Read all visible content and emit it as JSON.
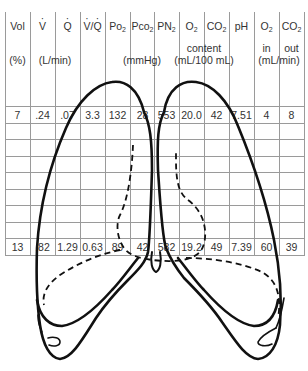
{
  "figure": {
    "columns": [
      {
        "key": "vol",
        "label": "Vol"
      },
      {
        "key": "v",
        "label": "V",
        "dot": true
      },
      {
        "key": "q",
        "label": "Q",
        "dot": true
      },
      {
        "key": "vq",
        "label_a": "V",
        "label_b": "/",
        "label_c": "Q",
        "dot": true
      },
      {
        "key": "po2",
        "label": "Po",
        "sub": "2"
      },
      {
        "key": "pco2",
        "label": "Pco",
        "sub": "2"
      },
      {
        "key": "pn2",
        "label": "PN",
        "sub": "2"
      },
      {
        "key": "o2c",
        "label": "O",
        "sub": "2"
      },
      {
        "key": "co2c",
        "label": "CO",
        "sub": "2"
      },
      {
        "key": "ph",
        "label": "pH"
      },
      {
        "key": "o2in",
        "label": "O",
        "sub": "2"
      },
      {
        "key": "co2out",
        "label": "CO",
        "sub": "2"
      }
    ],
    "units": {
      "vol": "(%)",
      "flow": "(L/min)",
      "pressure": "(mmHg)",
      "content_label": "content",
      "content_unit": "(mL/100 mL)",
      "in_label": "in",
      "out_label": "out",
      "exchange_unit": "(mL/min)"
    },
    "rows": [
      {
        "position": "apex",
        "values": [
          "7",
          ".24",
          ".07",
          "3.3",
          "132",
          "28",
          "553",
          "20.0",
          "42",
          "7.51",
          "4",
          "8"
        ]
      },
      {
        "position": "base",
        "values": [
          "13",
          ".82",
          "1.29",
          "0.63",
          "89",
          "42",
          "582",
          "19.2",
          "49",
          "7.39",
          "60",
          "39"
        ]
      }
    ],
    "colors": {
      "grid": "#9a9a9a",
      "outline": "#111111",
      "text": "#333333"
    }
  }
}
